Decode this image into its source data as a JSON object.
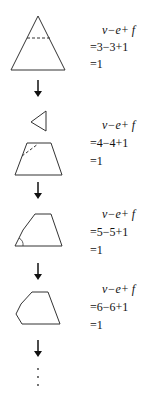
{
  "steps": [
    {
      "shape": "triangle with dashed cut line",
      "expr": "v−e+ f",
      "calc": "=3−3+1",
      "result": "=1"
    },
    {
      "shape": "cut-off triangle above trapezoid with dashed diagonal",
      "expr": "v−e+ f",
      "calc": "=4−4+1",
      "result": "=1"
    },
    {
      "shape": "pentagon with marked corner",
      "expr": "v−e+ f",
      "calc": "=5−5+1",
      "result": "=1"
    },
    {
      "shape": "hexagon",
      "expr": "v−e+ f",
      "calc": "=6−6+1",
      "result": "=1"
    }
  ],
  "arrows": [
    "down-arrow",
    "down-arrow",
    "down-arrow",
    "down-arrow"
  ],
  "continuation": "⋮",
  "colors": {
    "stroke": "#333333",
    "arrow": "#111111"
  }
}
